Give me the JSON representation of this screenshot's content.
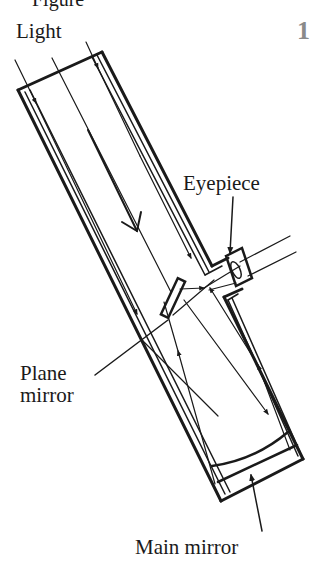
{
  "figure": {
    "number": "1",
    "partial_top_text": "Figure"
  },
  "labels": {
    "light": "Light",
    "eyepiece": "Eyepiece",
    "plane_mirror_line1": "Plane",
    "plane_mirror_line2": "mirror",
    "main_mirror": "Main mirror"
  },
  "colors": {
    "ink": "#1a1a1a",
    "figure_number": "#8a8a8a",
    "background": "#ffffff"
  }
}
